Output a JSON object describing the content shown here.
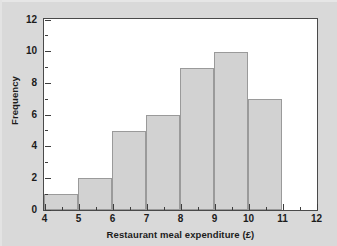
{
  "chart_data": {
    "type": "bar",
    "title": "",
    "subtitle": "",
    "xlabel": "Restaurant meal expenditure (£)",
    "ylabel": "Frequency",
    "xlim": [
      4,
      12
    ],
    "ylim": [
      0,
      12
    ],
    "xticks": [
      4,
      5,
      6,
      7,
      8,
      9,
      10,
      11,
      12
    ],
    "yticks": [
      0,
      2,
      4,
      6,
      8,
      10,
      12
    ],
    "xtick_labels": [
      "4",
      "5",
      "6",
      "7",
      "8",
      "9",
      "10",
      "11",
      "12"
    ],
    "ytick_labels": [
      "0",
      "2",
      "4",
      "6",
      "8",
      "10",
      "12"
    ],
    "minor_ticks": true,
    "grid": false,
    "legend": null,
    "bin_width": 1,
    "categories": [
      "4-5",
      "5-6",
      "6-7",
      "7-8",
      "8-9",
      "9-10",
      "10-11"
    ],
    "bin_edges": [
      4,
      5,
      6,
      7,
      8,
      9,
      10,
      11
    ],
    "values": [
      1,
      2,
      5,
      6,
      9,
      10,
      7
    ],
    "bars": [
      {
        "label": "4-5",
        "x0": 4,
        "x1": 5,
        "value": 1
      },
      {
        "label": "5-6",
        "x0": 5,
        "x1": 6,
        "value": 2
      },
      {
        "label": "6-7",
        "x0": 6,
        "x1": 7,
        "value": 5
      },
      {
        "label": "7-8",
        "x0": 7,
        "x1": 8,
        "value": 6
      },
      {
        "label": "8-9",
        "x0": 8,
        "x1": 9,
        "value": 9
      },
      {
        "label": "9-10",
        "x0": 9,
        "x1": 10,
        "value": 10
      },
      {
        "label": "10-11",
        "x0": 10,
        "x1": 11,
        "value": 7
      }
    ],
    "colors": {
      "bar_fill": "#d2d2d2",
      "bar_edge": "#9a9a9a",
      "frame": "#4a4a4a",
      "plot_background": "#ffffff",
      "figure_background": "#d9d9d9",
      "text": "#1c1c1c"
    }
  }
}
